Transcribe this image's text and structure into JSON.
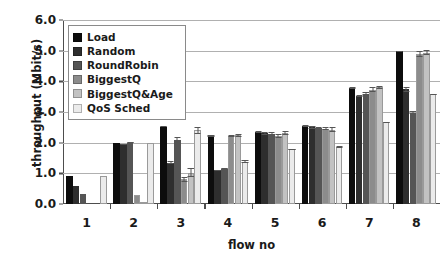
{
  "chart_data": {
    "type": "bar",
    "title": "",
    "xlabel": "flow no",
    "ylabel": "throughput (Mbit/s)",
    "categories": [
      "1",
      "2",
      "3",
      "4",
      "5",
      "6",
      "7",
      "8"
    ],
    "ylim": [
      0.0,
      6.0
    ],
    "ytick_labels": [
      "0.0",
      "1.0",
      "2.0",
      "3.0",
      "4.0",
      "5.0",
      "6.0"
    ],
    "ytick_values": [
      0.0,
      1.0,
      2.0,
      3.0,
      4.0,
      5.0,
      6.0
    ],
    "grid": "horizontal",
    "legend_position": "upper-left-inside",
    "error_bars": true,
    "series": [
      {
        "name": "Load",
        "color": "#0d0d0d",
        "values": [
          0.9,
          2.0,
          2.52,
          2.22,
          2.34,
          2.54,
          3.78,
          4.98
        ],
        "errors": [
          0.0,
          0.0,
          0.02,
          0.02,
          0.04,
          0.04,
          0.04,
          0.02
        ]
      },
      {
        "name": "Random",
        "color": "#2e2e2e",
        "values": [
          0.6,
          1.95,
          1.35,
          1.1,
          2.3,
          2.5,
          3.52,
          3.74
        ],
        "errors": [
          0.0,
          0.02,
          0.04,
          0.02,
          0.06,
          0.04,
          0.04,
          0.08
        ]
      },
      {
        "name": "RoundRobin",
        "color": "#555555",
        "values": [
          0.32,
          2.0,
          2.08,
          1.15,
          2.28,
          2.48,
          3.6,
          2.98
        ],
        "errors": [
          0.0,
          0.02,
          0.12,
          0.02,
          0.08,
          0.04,
          0.06,
          0.04
        ]
      },
      {
        "name": "BiggestQ",
        "color": "#8c8c8c",
        "values": [
          0.0,
          0.3,
          0.8,
          2.22,
          2.22,
          2.46,
          3.72,
          4.88
        ],
        "errors": [
          0.0,
          0.0,
          0.08,
          0.04,
          0.06,
          0.04,
          0.08,
          0.1
        ]
      },
      {
        "name": "BiggestQ&Age",
        "color": "#c2c2c2",
        "values": [
          0.0,
          0.08,
          1.02,
          2.24,
          2.32,
          2.42,
          3.8,
          4.94
        ],
        "errors": [
          0.0,
          0.0,
          0.14,
          0.04,
          0.06,
          0.08,
          0.06,
          0.08
        ]
      },
      {
        "name": "QoS Sched",
        "color": "#ebebeb",
        "values": [
          0.92,
          2.0,
          2.4,
          1.38,
          1.78,
          1.86,
          2.66,
          3.58
        ],
        "errors": [
          0.0,
          0.0,
          0.12,
          0.04,
          0.02,
          0.02,
          0.02,
          0.02
        ]
      }
    ]
  },
  "axes": {
    "y_title": "throughput (Mbit/s)",
    "x_title": "flow no"
  },
  "legend": {
    "items": [
      {
        "label": "Load",
        "color": "#0d0d0d"
      },
      {
        "label": "Random",
        "color": "#2e2e2e"
      },
      {
        "label": "RoundRobin",
        "color": "#555555"
      },
      {
        "label": "BiggestQ",
        "color": "#8c8c8c"
      },
      {
        "label": "BiggestQ&Age",
        "color": "#c2c2c2"
      },
      {
        "label": "QoS Sched",
        "color": "#ebebeb"
      }
    ]
  }
}
